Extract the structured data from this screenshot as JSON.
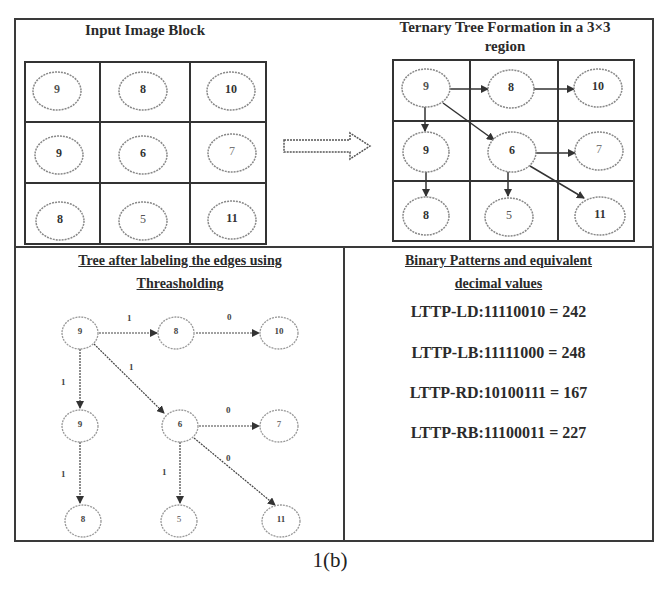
{
  "panels": {
    "input": {
      "title": "Input Image Block",
      "grid": [
        [
          "9",
          "8",
          "10"
        ],
        [
          "9",
          "6",
          "7"
        ],
        [
          "8",
          "5",
          "11"
        ]
      ]
    },
    "ternary": {
      "title_line1": "Ternary Tree Formation in a 3×3",
      "title_line2": "region",
      "grid": [
        [
          "9",
          "8",
          "10"
        ],
        [
          "9",
          "6",
          "7"
        ],
        [
          "8",
          "5",
          "11"
        ]
      ],
      "edges": [
        {
          "from": "r0c0",
          "to": "r0c1"
        },
        {
          "from": "r0c1",
          "to": "r0c2"
        },
        {
          "from": "r0c0",
          "to": "r1c0"
        },
        {
          "from": "r0c0",
          "to": "r1c1"
        },
        {
          "from": "r1c0",
          "to": "r2c0"
        },
        {
          "from": "r1c1",
          "to": "r1c2"
        },
        {
          "from": "r1c1",
          "to": "r2c1"
        },
        {
          "from": "r1c1",
          "to": "r2c2"
        }
      ]
    },
    "threshold_tree": {
      "title_line1": "Tree after labeling the edges using",
      "title_line2": "Threasholding",
      "nodes": {
        "a": "9",
        "b": "8",
        "c": "10",
        "d": "9",
        "e": "6",
        "f": "7",
        "g": "8",
        "h": "5",
        "i": "11"
      },
      "edge_labels": {
        "a_b": "1",
        "b_c": "0",
        "a_d": "1",
        "a_e": "1",
        "e_f": "0",
        "e_i": "0",
        "d_g": "1",
        "e_h": "1"
      }
    },
    "binary": {
      "title_line1": "Binary Patterns and equivalent",
      "title_line2": "decimal values",
      "patterns": [
        "LTTP-LD:11110010 = 242",
        "LTTP-LB:11111000 = 248",
        "LTTP-RD:10100111 = 167",
        "LTTP-RB:11100011 = 227"
      ]
    }
  },
  "caption": "1(b)",
  "colors": {
    "line": "#3a3a3a",
    "node_stroke": "#777777",
    "background": "#ffffff"
  }
}
